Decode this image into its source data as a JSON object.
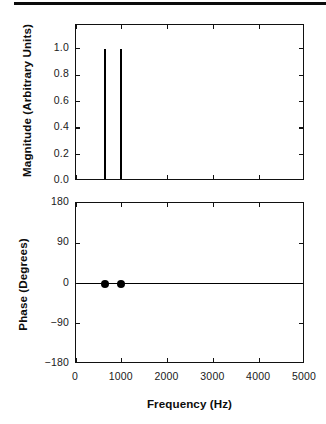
{
  "figure": {
    "xlabel": "Frequency (Hz)",
    "edge_bar": "page-edge-artifact"
  },
  "chart_data": [
    {
      "type": "bar",
      "panel": "magnitude",
      "title": "",
      "xlabel": "Frequency (Hz)",
      "ylabel": "Magnitude (Arbitrary Units)",
      "x": [
        630,
        980
      ],
      "values": [
        1.0,
        1.0
      ],
      "xlim": [
        0,
        5000
      ],
      "ylim": [
        0.0,
        1.18
      ],
      "xticks": [
        0,
        1000,
        2000,
        3000,
        4000,
        5000
      ],
      "xticklabels": [
        "0",
        "1000",
        "2000",
        "3000",
        "4000",
        "5000"
      ],
      "yticks": [
        0.0,
        0.2,
        0.4,
        0.6,
        0.8,
        1.0
      ],
      "yticklabels": [
        "0.0",
        "0.2",
        "0.4",
        "0.6",
        "0.8",
        "1.0"
      ],
      "grid": false,
      "legend": "none"
    },
    {
      "type": "scatter",
      "panel": "phase",
      "title": "",
      "xlabel": "Frequency (Hz)",
      "ylabel": "Phase (Degrees)",
      "x": [
        630,
        980
      ],
      "values": [
        0,
        0
      ],
      "baseline": 0,
      "xlim": [
        0,
        5000
      ],
      "ylim": [
        -180,
        180
      ],
      "xticks": [
        0,
        1000,
        2000,
        3000,
        4000,
        5000
      ],
      "xticklabels": [
        "0",
        "1000",
        "2000",
        "3000",
        "4000",
        "5000"
      ],
      "yticks": [
        180,
        90,
        0,
        -90,
        -180
      ],
      "yticklabels": [
        "180",
        "90",
        "0",
        "−90",
        "−180"
      ],
      "grid": false,
      "legend": "none"
    }
  ],
  "magnitude_panel": {
    "ylabel": "Magnitude (Arbitrary Units)",
    "yticklabels": [
      "1.0",
      "0.8",
      "0.6",
      "0.4",
      "0.2",
      "0.0"
    ]
  },
  "phase_panel": {
    "ylabel": "Phase (Degrees)",
    "yticklabels": [
      "180",
      "90",
      "0",
      "−90",
      "−180"
    ]
  },
  "xaxis": {
    "label": "Frequency (Hz)",
    "ticklabels": [
      "0",
      "1000",
      "2000",
      "3000",
      "4000",
      "5000"
    ]
  }
}
